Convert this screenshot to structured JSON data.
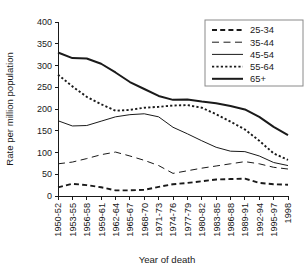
{
  "chart_data": {
    "type": "line",
    "title": "",
    "xlabel": "Year of death",
    "ylabel": "Rate per million population",
    "ylim": [
      0,
      400
    ],
    "yticks": [
      0,
      50,
      100,
      150,
      200,
      250,
      300,
      350,
      400
    ],
    "grid": false,
    "legend_position": "top-right",
    "categories": [
      "1950-52",
      "1953-55",
      "1956-58",
      "1959-61",
      "1962-64",
      "1965-67",
      "1968-70",
      "1971-73",
      "1974-76",
      "1977-79",
      "1980-82",
      "1983-85",
      "1986-88",
      "1989-91",
      "1992-94",
      "1995-97",
      "1998"
    ],
    "series": [
      {
        "name": "25-34",
        "style": "dashed-thick",
        "values": [
          20,
          28,
          25,
          20,
          13,
          13,
          14,
          21,
          27,
          30,
          34,
          38,
          39,
          40,
          30,
          27,
          26
        ]
      },
      {
        "name": "35-44",
        "style": "longdash-thin",
        "values": [
          74,
          78,
          86,
          95,
          101,
          92,
          82,
          70,
          52,
          58,
          64,
          69,
          74,
          79,
          74,
          66,
          62
        ]
      },
      {
        "name": "45-54",
        "style": "solid-thin",
        "values": [
          173,
          161,
          162,
          172,
          182,
          187,
          189,
          182,
          158,
          143,
          127,
          112,
          103,
          102,
          92,
          77,
          70
        ]
      },
      {
        "name": "55-64",
        "style": "dotted",
        "values": [
          279,
          252,
          228,
          211,
          196,
          198,
          203,
          205,
          208,
          209,
          203,
          188,
          171,
          153,
          127,
          98,
          83
        ]
      },
      {
        "name": "65+",
        "style": "solid-thick",
        "values": [
          330,
          317,
          316,
          304,
          284,
          262,
          246,
          230,
          221,
          222,
          217,
          213,
          207,
          199,
          182,
          159,
          140
        ]
      }
    ]
  },
  "legend": {
    "entries": [
      {
        "label": "25-34"
      },
      {
        "label": "35-44"
      },
      {
        "label": "45-54"
      },
      {
        "label": "55-64"
      },
      {
        "label": "65+"
      }
    ]
  }
}
